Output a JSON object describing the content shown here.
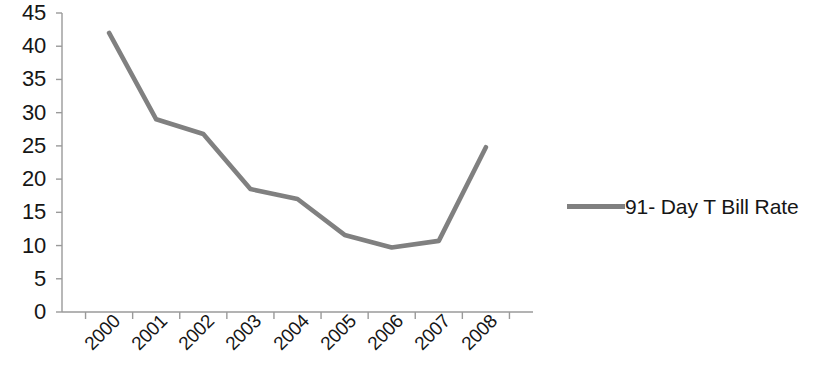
{
  "chart_data": {
    "type": "line",
    "title": "",
    "subtitle": "",
    "xlabel": "",
    "ylabel": "",
    "categories": [
      "2000",
      "2001",
      "2002",
      "2003",
      "2004",
      "2005",
      "2006",
      "2007",
      "2008"
    ],
    "series": [
      {
        "name": "91- Day T Bill Rate",
        "color": "#808080",
        "values": [
          42.0,
          29.0,
          26.8,
          18.5,
          17.0,
          11.6,
          9.7,
          10.7,
          24.8
        ]
      }
    ],
    "ylim": [
      0,
      45
    ],
    "y_ticks": [
      "0",
      "5",
      "10",
      "15",
      "20",
      "25",
      "30",
      "35",
      "40",
      "45"
    ],
    "y_tick_values": [
      0,
      5,
      10,
      15,
      20,
      25,
      30,
      35,
      40,
      45
    ],
    "grid": false,
    "legend": {
      "position": "right",
      "entries": [
        {
          "label": "91- Day T Bill Rate",
          "swatch_color": "#808080"
        }
      ]
    },
    "axis_color": "#9a9a9a",
    "background_color": "#ffffff",
    "text_color": "#161616"
  }
}
